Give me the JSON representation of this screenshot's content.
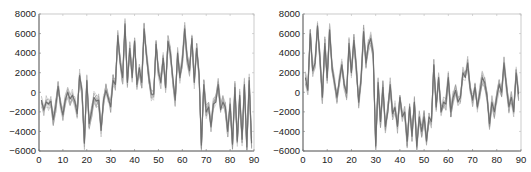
{
  "chart_data": [
    {
      "type": "line",
      "title": "",
      "xlabel": "",
      "ylabel": "",
      "xlim": [
        0,
        90
      ],
      "ylim": [
        -6000,
        8000
      ],
      "xticks": [
        0,
        10,
        20,
        30,
        40,
        50,
        60,
        70,
        80,
        90
      ],
      "yticks": [
        -6000,
        -4000,
        -2000,
        0,
        2000,
        4000,
        6000,
        8000
      ],
      "grid": false,
      "legend": null,
      "line_color": "#7a7a7a",
      "description": "Multiple overlapping gray traces (~10 realizations) of a 90-sample signal; low (~-1000) for x 0-31, high (~2000-6000) for x 32-67, low (~-2000) for x 68-89",
      "x": [
        1,
        2,
        3,
        4,
        5,
        6,
        7,
        8,
        9,
        10,
        11,
        12,
        13,
        14,
        15,
        16,
        17,
        18,
        19,
        20,
        21,
        22,
        23,
        24,
        25,
        26,
        27,
        28,
        29,
        30,
        31,
        32,
        33,
        34,
        35,
        36,
        37,
        38,
        39,
        40,
        41,
        42,
        43,
        44,
        45,
        46,
        47,
        48,
        49,
        50,
        51,
        52,
        53,
        54,
        55,
        56,
        57,
        58,
        59,
        60,
        61,
        62,
        63,
        64,
        65,
        66,
        67,
        68,
        69,
        70,
        71,
        72,
        73,
        74,
        75,
        76,
        77,
        78,
        79,
        80,
        81,
        82,
        83,
        84,
        85,
        86,
        87,
        88,
        89
      ],
      "series": [
        {
          "name": "mean",
          "values": [
            -800,
            -1800,
            -1000,
            -1200,
            -900,
            -2800,
            -1500,
            600,
            -1200,
            -2300,
            -800,
            0,
            -700,
            -300,
            -900,
            -2200,
            1700,
            200,
            -5200,
            1200,
            -3200,
            -2000,
            -500,
            -900,
            -800,
            -3900,
            -800,
            200,
            -600,
            -1500,
            1200,
            800,
            5800,
            3000,
            1500,
            7000,
            1000,
            4500,
            1500,
            5200,
            800,
            2500,
            1000,
            6500,
            3800,
            1500,
            -200,
            -200,
            4900,
            2200,
            1000,
            3500,
            500,
            5200,
            4000,
            1500,
            -800,
            4000,
            1500,
            3200,
            6500,
            3500,
            2200,
            5500,
            1000,
            4500,
            1800,
            -5400,
            800,
            -2000,
            -1500,
            -3500,
            -1200,
            -1000,
            800,
            -1800,
            -1000,
            -1500,
            -4000,
            -1200,
            -5300,
            500,
            -5000,
            -300,
            -4800,
            800,
            -5600,
            1200,
            -5200
          ]
        }
      ]
    },
    {
      "type": "line",
      "title": "",
      "xlabel": "",
      "ylabel": "",
      "xlim": [
        0,
        90
      ],
      "ylim": [
        -6000,
        8000
      ],
      "xticks": [
        0,
        10,
        20,
        30,
        40,
        50,
        60,
        70,
        80,
        90
      ],
      "yticks": [
        -6000,
        -4000,
        -2000,
        0,
        2000,
        4000,
        6000,
        8000
      ],
      "grid": false,
      "legend": null,
      "line_color": "#7a7a7a",
      "description": "Multiple overlapping gray traces of a 90-sample signal; high (~2000-6000) for x 0-29, low (~-2000 to -5000) for x 30-53, near 0 for x 54-89",
      "x": [
        1,
        2,
        3,
        4,
        5,
        6,
        7,
        8,
        9,
        10,
        11,
        12,
        13,
        14,
        15,
        16,
        17,
        18,
        19,
        20,
        21,
        22,
        23,
        24,
        25,
        26,
        27,
        28,
        29,
        30,
        31,
        32,
        33,
        34,
        35,
        36,
        37,
        38,
        39,
        40,
        41,
        42,
        43,
        44,
        45,
        46,
        47,
        48,
        49,
        50,
        51,
        52,
        53,
        54,
        55,
        56,
        57,
        58,
        59,
        60,
        61,
        62,
        63,
        64,
        65,
        66,
        67,
        68,
        69,
        70,
        71,
        72,
        73,
        74,
        75,
        76,
        77,
        78,
        79,
        80,
        81,
        82,
        83,
        84,
        85,
        86,
        87,
        88,
        89
      ],
      "series": [
        {
          "name": "mean",
          "values": [
            1500,
            200,
            6000,
            2200,
            3000,
            6800,
            3500,
            -500,
            5000,
            1500,
            6400,
            2500,
            1000,
            -500,
            1200,
            2800,
            800,
            -100,
            5000,
            2000,
            5300,
            2500,
            -1000,
            1500,
            6200,
            3000,
            4800,
            5500,
            4000,
            -5500,
            1000,
            -3000,
            500,
            -3500,
            -2000,
            800,
            -2200,
            -1500,
            -3500,
            -500,
            -2500,
            -2000,
            -5000,
            -1500,
            -4500,
            -1000,
            -5500,
            -2500,
            -4000,
            -2500,
            -5000,
            -2500,
            -3000,
            2800,
            -1500,
            1500,
            -2000,
            -1000,
            -1200,
            1500,
            -2000,
            -500,
            200,
            -1000,
            -500,
            2000,
            1500,
            3000,
            500,
            -800,
            500,
            -1500,
            0,
            1500,
            1000,
            -500,
            -3200,
            -1000,
            -2000,
            -500,
            800,
            0,
            3000,
            500,
            -1500,
            -500,
            -2000,
            2000,
            -200
          ]
        }
      ]
    }
  ]
}
